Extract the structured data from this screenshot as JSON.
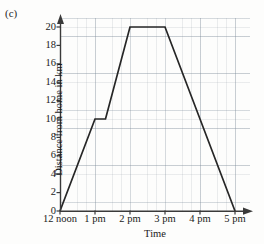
{
  "figure": {
    "part_label": "(c)"
  },
  "chart_data": {
    "type": "line",
    "title": "",
    "subtitle": "",
    "xlabel": "Time",
    "ylabel": "Distance from home in km",
    "xtick_labels": [
      "12 noon",
      "1 pm",
      "2 pm",
      "3 pm",
      "4 pm",
      "5 pm"
    ],
    "xtick_values": [
      12,
      13,
      14,
      15,
      16,
      17
    ],
    "ytick_labels": [
      "0",
      "2",
      "4",
      "6",
      "8",
      "10",
      "12",
      "14",
      "16",
      "18",
      "20"
    ],
    "ytick_values": [
      0,
      2,
      4,
      6,
      8,
      10,
      12,
      14,
      16,
      18,
      20
    ],
    "xlim": [
      12,
      17.4
    ],
    "ylim": [
      0,
      21
    ],
    "grid": true,
    "grid_style": "graph-paper",
    "legend": "none",
    "line_color": "#262626",
    "grid_color": "#8c96a0",
    "axis_color": "#3a3a3a",
    "series": [
      {
        "name": "Distance from home",
        "points": [
          {
            "x": 12.0,
            "y": 0,
            "label": "12 noon, 0 km"
          },
          {
            "x": 13.0,
            "y": 10,
            "label": "1 pm, 10 km"
          },
          {
            "x": 13.3,
            "y": 10,
            "label": "1:18 pm, 10 km"
          },
          {
            "x": 14.0,
            "y": 20,
            "label": "2 pm, 20 km"
          },
          {
            "x": 15.0,
            "y": 20,
            "label": "3 pm, 20 km"
          },
          {
            "x": 17.0,
            "y": 0,
            "label": "5 pm, 0 km"
          }
        ]
      }
    ],
    "annotations": []
  }
}
